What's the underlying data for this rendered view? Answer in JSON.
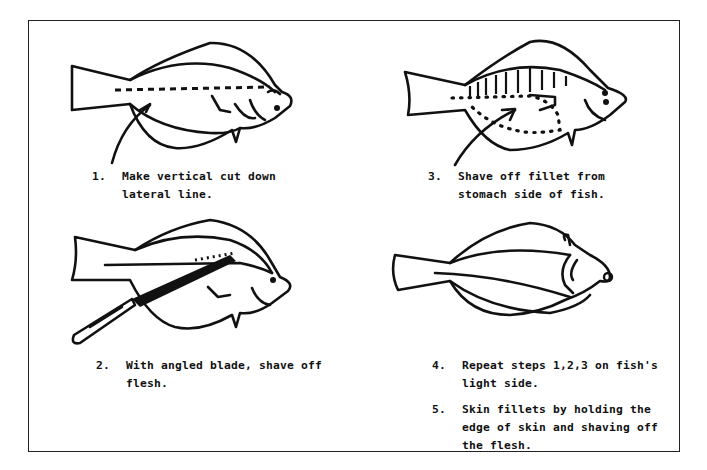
{
  "document": {
    "type": "instructional illustration",
    "subject": "filleting a flatfish"
  },
  "panels": [
    {
      "figure": "fish-lateral-line-cut",
      "steps": [
        {
          "number": "1.",
          "text": "Make vertical cut down lateral line."
        }
      ]
    },
    {
      "figure": "fish-shaving-with-knife",
      "steps": [
        {
          "number": "2.",
          "text": "With angled blade,  shave off flesh."
        }
      ]
    },
    {
      "figure": "fish-stomach-fillet",
      "steps": [
        {
          "number": "3.",
          "text": "Shave off fillet from stomach side of fish."
        }
      ]
    },
    {
      "figure": "fish-light-side",
      "steps": [
        {
          "number": "4.",
          "text": "Repeat steps 1,2,3  on fish's light side."
        },
        {
          "number": "5.",
          "text": "Skin fillets by holding the edge of skin and shaving off the flesh."
        }
      ]
    }
  ]
}
